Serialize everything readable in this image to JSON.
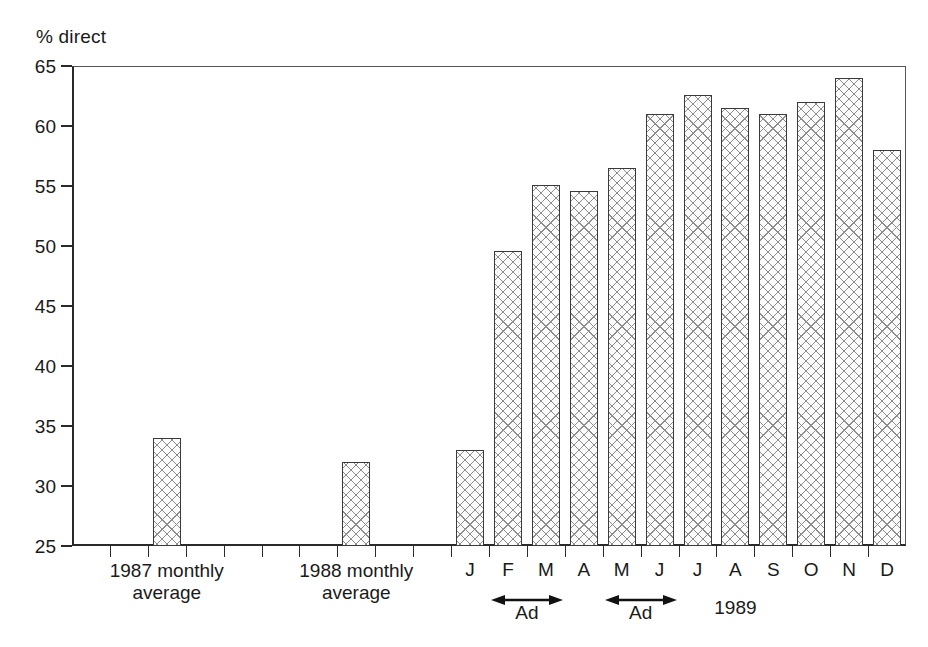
{
  "chart_data": {
    "type": "bar",
    "title": "",
    "subtitle": "",
    "ylabel": "% direct",
    "xlabel": "",
    "ylim": [
      25,
      65
    ],
    "ytick_step": 5,
    "yticks": [
      25,
      30,
      35,
      40,
      45,
      50,
      55,
      60,
      65
    ],
    "ytick_labels": [
      "25",
      "30",
      "35",
      "40",
      "45",
      "50",
      "55",
      "60",
      "65"
    ],
    "grid": false,
    "legend": null,
    "categories": [
      "1987 monthly average",
      "1988 monthly average",
      "J",
      "F",
      "M",
      "A",
      "M",
      "J",
      "J",
      "A",
      "S",
      "O",
      "N",
      "D"
    ],
    "values": [
      34.0,
      32.0,
      33.0,
      49.6,
      55.1,
      54.6,
      56.5,
      61.0,
      62.6,
      61.5,
      61.0,
      62.0,
      64.0,
      58.0
    ],
    "bar_style": {
      "fill": "cross-hatch",
      "edge_color": "#3a3a3a",
      "face_color": "#fbfbfb",
      "hatch_color": "#8d8d8d"
    },
    "annotations": [
      {
        "type": "arrow-span",
        "label": "Ad",
        "from": "F",
        "to": "M"
      },
      {
        "type": "arrow-span",
        "label": "Ad",
        "from": "M",
        "to": "J"
      },
      {
        "type": "text",
        "label": "1989"
      }
    ]
  },
  "axis": {
    "y_title": "% direct",
    "ticks": [
      {
        "value": 65,
        "label": "65"
      },
      {
        "value": 60,
        "label": "60"
      },
      {
        "value": 55,
        "label": "55"
      },
      {
        "value": 50,
        "label": "50"
      },
      {
        "value": 45,
        "label": "45"
      },
      {
        "value": 40,
        "label": "40"
      },
      {
        "value": 35,
        "label": "35"
      },
      {
        "value": 30,
        "label": "30"
      },
      {
        "value": 25,
        "label": "25"
      }
    ]
  },
  "x_labels": {
    "group_1987_line1": "1987 monthly",
    "group_1987_line2": "average",
    "group_1988_line1": "1988 monthly",
    "group_1988_line2": "average",
    "months": [
      "J",
      "F",
      "M",
      "A",
      "M",
      "J",
      "J",
      "A",
      "S",
      "O",
      "N",
      "D"
    ],
    "year": "1989"
  },
  "annotations": {
    "ad_1_label": "Ad",
    "ad_2_label": "Ad"
  },
  "colors": {
    "axis": "#2a2a2a",
    "frame": "#555555",
    "bar_edge": "#3a3a3a",
    "bar_face": "#fbfbfb",
    "hatch": "#8d8d8d",
    "text": "#1a1a1a",
    "background": "#ffffff"
  }
}
